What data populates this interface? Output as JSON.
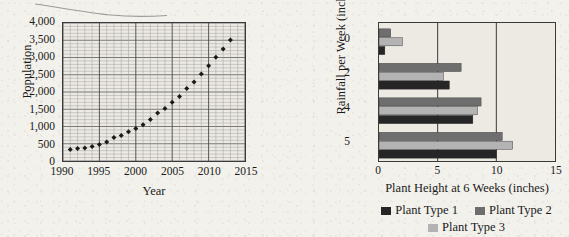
{
  "artifact": {
    "name": "scanned-line-streak"
  },
  "charts": {
    "population": {
      "ylabel": "Population",
      "xlabel": "Year",
      "yticks": [
        "4,000",
        "3,500",
        "3,000",
        "2,500",
        "2,000",
        "1,500",
        "1,000",
        "500",
        "0"
      ],
      "xticks": [
        "1990",
        "1995",
        "2000",
        "2005",
        "2010",
        "2015"
      ]
    },
    "rainfall": {
      "ylabel": "Rainfall per Week (inches)",
      "xlabel": "Plant Height at 6 Weeks (inches)",
      "yticks": [
        "0",
        "2",
        "4",
        "5"
      ],
      "xticks": [
        "0",
        "5",
        "10",
        "15"
      ],
      "legend": [
        {
          "label": "Plant Type 1",
          "color": "#262626"
        },
        {
          "label": "Plant Type 2",
          "color": "#6e6e6e"
        },
        {
          "label": "Plant Type 3",
          "color": "#b3b3b3"
        }
      ]
    }
  },
  "chart_data": [
    {
      "id": "population-scatter",
      "type": "scatter",
      "title": "",
      "xlabel": "Year",
      "ylabel": "Population",
      "xlim": [
        1990,
        2015
      ],
      "ylim": [
        0,
        4000
      ],
      "xticks": [
        1990,
        1995,
        2000,
        2005,
        2010,
        2015
      ],
      "yticks": [
        0,
        500,
        1000,
        1500,
        2000,
        2500,
        3000,
        3500,
        4000
      ],
      "grid": true,
      "grid_minor": true,
      "marker": "diamond",
      "marker_color": "#1a1a1a",
      "legend": "none",
      "x": [
        1991,
        1992,
        1993,
        1994,
        1995,
        1996,
        1997,
        1998,
        1999,
        2000,
        2001,
        2002,
        2003,
        2004,
        2005,
        2006,
        2007,
        2008,
        2009,
        2010,
        2011,
        2012,
        2013
      ],
      "y": [
        330,
        360,
        375,
        420,
        480,
        550,
        680,
        740,
        850,
        940,
        1050,
        1200,
        1390,
        1520,
        1700,
        1870,
        2100,
        2290,
        2520,
        2760,
        3010,
        3250,
        3510
      ]
    },
    {
      "id": "rainfall-plant-height",
      "type": "bar",
      "orientation": "horizontal",
      "title": "",
      "xlabel": "Plant Height at 6 Weeks (inches)",
      "ylabel": "Rainfall per Week (inches)",
      "xlim": [
        0,
        15
      ],
      "xticks": [
        0,
        5,
        10,
        15
      ],
      "categories": [
        "0",
        "2",
        "4",
        "5"
      ],
      "grid": true,
      "legend_position": "bottom",
      "series": [
        {
          "name": "Plant Type 1",
          "color": "#262626",
          "values": [
            0.5,
            6.0,
            8.0,
            10.0
          ]
        },
        {
          "name": "Plant Type 2",
          "color": "#6e6e6e",
          "values": [
            1.0,
            7.0,
            8.7,
            10.5
          ]
        },
        {
          "name": "Plant Type 3",
          "color": "#b3b3b3",
          "values": [
            2.0,
            5.5,
            8.4,
            11.4
          ]
        }
      ]
    }
  ]
}
